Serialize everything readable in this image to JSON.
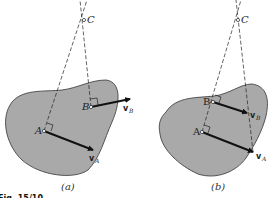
{
  "figure": {
    "caption_partial": "Fig. 15/10",
    "colors": {
      "body_fill": "#a9a9a9",
      "outline": "#333333",
      "line": "#222222"
    },
    "panels": [
      {
        "id": "a",
        "label": "(a)",
        "points": {
          "C": "C",
          "A": "A",
          "B": "B"
        },
        "vectors": {
          "vA": {
            "main": "v",
            "sub": "A"
          },
          "vB": {
            "main": "v",
            "sub": "B"
          }
        }
      },
      {
        "id": "b",
        "label": "(b)",
        "points": {
          "C": "C",
          "A": "A",
          "B": "B"
        },
        "vectors": {
          "vA": {
            "main": "v",
            "sub": "A"
          },
          "vB": {
            "main": "v",
            "sub": "B"
          }
        }
      }
    ]
  }
}
